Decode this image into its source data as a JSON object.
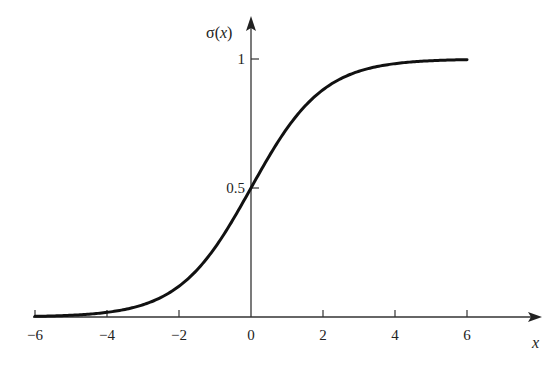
{
  "chart_data": {
    "type": "line",
    "title": "",
    "xlabel": "x",
    "ylabel": "σ(x)",
    "ylabel_parts": {
      "fn": "σ(",
      "var": "x",
      "close": ")"
    },
    "xlim": [
      -6,
      6
    ],
    "ylim": [
      0,
      1
    ],
    "x_ticks": [
      -6,
      -4,
      -2,
      0,
      2,
      4,
      6
    ],
    "x_tick_labels": [
      "−6",
      "−4",
      "−2",
      "0",
      "2",
      "4",
      "6"
    ],
    "y_ticks": [
      0.5,
      1
    ],
    "y_tick_labels": [
      "0.5",
      "1"
    ],
    "grid": false,
    "legend": null,
    "series": [
      {
        "name": "sigmoid σ(x) = 1 / (1 + e^(−x))",
        "x": [
          -6,
          -5,
          -4,
          -3,
          -2,
          -1,
          0,
          1,
          2,
          3,
          4,
          5,
          6
        ],
        "values": [
          0.0025,
          0.0067,
          0.018,
          0.047,
          0.119,
          0.269,
          0.5,
          0.731,
          0.881,
          0.953,
          0.982,
          0.993,
          0.9975
        ]
      }
    ],
    "colors": {
      "line": "#111111",
      "axis": "#333333",
      "background": "#ffffff"
    }
  }
}
